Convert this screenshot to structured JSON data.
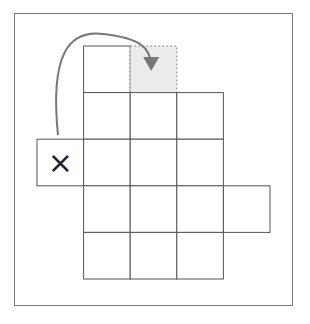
{
  "diagram": {
    "title": "",
    "grid": {
      "description": "Net of unit squares arranged in rows",
      "rows": [
        {
          "row": 0,
          "cells": [
            {
              "col": 1,
              "type": "empty"
            },
            {
              "col": 2,
              "type": "target-dashed"
            }
          ]
        },
        {
          "row": 1,
          "cells": [
            {
              "col": 1,
              "type": "empty"
            },
            {
              "col": 2,
              "type": "empty"
            },
            {
              "col": 3,
              "type": "empty"
            }
          ]
        },
        {
          "row": 2,
          "cells": [
            {
              "col": 0,
              "type": "marked",
              "mark": "×"
            },
            {
              "col": 1,
              "type": "empty"
            },
            {
              "col": 2,
              "type": "empty"
            },
            {
              "col": 3,
              "type": "empty"
            }
          ]
        },
        {
          "row": 3,
          "cells": [
            {
              "col": 1,
              "type": "empty"
            },
            {
              "col": 2,
              "type": "empty"
            },
            {
              "col": 3,
              "type": "empty"
            },
            {
              "col": 4,
              "type": "empty"
            }
          ]
        },
        {
          "row": 4,
          "cells": [
            {
              "col": 1,
              "type": "empty"
            },
            {
              "col": 2,
              "type": "empty"
            },
            {
              "col": 3,
              "type": "empty"
            }
          ]
        }
      ]
    },
    "mark_symbol": "×",
    "arrow": {
      "from": {
        "row": 2,
        "col": 0
      },
      "to": {
        "row": 0,
        "col": 2
      },
      "style": "curved"
    },
    "colors": {
      "cell_border": "#555555",
      "target_fill": "#ececec",
      "target_border": "#888888",
      "arrow": "#777777",
      "frame": "#777777",
      "mark": "#222222"
    }
  }
}
